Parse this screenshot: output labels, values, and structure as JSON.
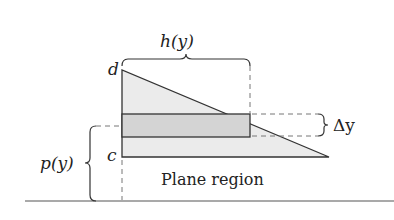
{
  "diagram": {
    "labels": {
      "h": "h(y)",
      "d": "d",
      "c": "c",
      "p": "p(y)",
      "dy": "Δy",
      "region": "Plane region"
    },
    "colors": {
      "region_fill": "#ebebeb",
      "strip_fill": "#d4d4d4",
      "stroke": "#333333",
      "dash": "#777777"
    }
  }
}
